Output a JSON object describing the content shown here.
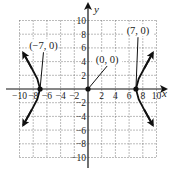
{
  "chart_data": {
    "type": "line",
    "title": "",
    "xlabel": "x",
    "ylabel": "y",
    "xlim": [
      -10,
      10
    ],
    "ylim": [
      -10,
      10
    ],
    "grid": true,
    "grid_style": "dotted",
    "grid_step": 2,
    "x_tick_labels": [
      "-10",
      "-8",
      "-6",
      "-4",
      "-2",
      "2",
      "4",
      "6",
      "8",
      "10"
    ],
    "y_tick_labels": [
      "10",
      "8",
      "6",
      "4",
      "2",
      "-2",
      "-4",
      "-6",
      "-8",
      "-10"
    ],
    "series": [
      {
        "name": "hyperbola-left-branch",
        "description": "x^2/49 - y^2/b^2 = 1, left branch opening left, arrows at both ends",
        "points": [
          [
            -9.3,
            5.0
          ],
          [
            -8.2,
            3.0
          ],
          [
            -7.4,
            1.5
          ],
          [
            -7.0,
            0.0
          ],
          [
            -7.4,
            -1.5
          ],
          [
            -8.2,
            -3.0
          ],
          [
            -9.3,
            -5.0
          ]
        ]
      },
      {
        "name": "hyperbola-right-branch",
        "description": "right branch opening right, arrows at both ends",
        "points": [
          [
            9.3,
            5.0
          ],
          [
            8.2,
            3.0
          ],
          [
            7.4,
            1.5
          ],
          [
            7.0,
            0.0
          ],
          [
            7.4,
            -1.5
          ],
          [
            8.2,
            -3.0
          ],
          [
            9.3,
            -5.0
          ]
        ]
      }
    ],
    "annotations": [
      {
        "label": "(−7, 0)",
        "point": [
          -7,
          0
        ],
        "text_at": [
          -6.5,
          5.8
        ],
        "kind": "vertex"
      },
      {
        "label": "(0, 0)",
        "point": [
          0,
          0
        ],
        "text_at": [
          2.8,
          3.8
        ],
        "kind": "center"
      },
      {
        "label": "(7, 0)",
        "point": [
          7,
          0
        ],
        "text_at": [
          7.3,
          8.0
        ],
        "kind": "vertex"
      }
    ],
    "marked_points": [
      [
        -7,
        0
      ],
      [
        0,
        0
      ],
      [
        7,
        0
      ]
    ]
  },
  "labels": {
    "x_axis": "x",
    "y_axis": "y",
    "left_vertex": "(−7, 0)",
    "center": "(0, 0)",
    "right_vertex": "(7, 0)"
  }
}
